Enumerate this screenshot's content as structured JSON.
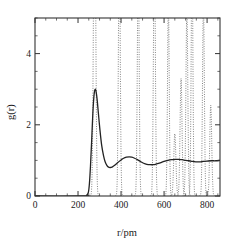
{
  "chart_data": {
    "type": "line",
    "title": "",
    "xlabel": "r/pm",
    "ylabel": "g(r)",
    "xlim": [
      0,
      860
    ],
    "ylim": [
      0,
      5.0
    ],
    "xticks": [
      0,
      200,
      400,
      600,
      800
    ],
    "xtick_labels": [
      "0",
      "200",
      "400",
      "600",
      "800"
    ],
    "yticks": [
      0,
      2,
      4
    ],
    "ytick_labels": [
      "0",
      "2",
      "4"
    ],
    "xminor_interval": 50,
    "yminor_interval": 0.5,
    "grid": false,
    "legend": null,
    "series": [
      {
        "name": "liquid radial distribution function",
        "style": "solid",
        "color": "#222222",
        "linewidth": 1.3,
        "points": [
          [
            0,
            0
          ],
          [
            230,
            0
          ],
          [
            240,
            0.02
          ],
          [
            248,
            0.1
          ],
          [
            253,
            0.35
          ],
          [
            258,
            0.85
          ],
          [
            263,
            1.5
          ],
          [
            268,
            2.2
          ],
          [
            272,
            2.65
          ],
          [
            276,
            2.92
          ],
          [
            280,
            3.0
          ],
          [
            284,
            2.93
          ],
          [
            289,
            2.7
          ],
          [
            295,
            2.3
          ],
          [
            302,
            1.85
          ],
          [
            310,
            1.42
          ],
          [
            318,
            1.15
          ],
          [
            326,
            0.96
          ],
          [
            334,
            0.86
          ],
          [
            342,
            0.81
          ],
          [
            350,
            0.8
          ],
          [
            360,
            0.82
          ],
          [
            372,
            0.87
          ],
          [
            385,
            0.94
          ],
          [
            398,
            1.0
          ],
          [
            412,
            1.06
          ],
          [
            425,
            1.09
          ],
          [
            438,
            1.1
          ],
          [
            450,
            1.09
          ],
          [
            463,
            1.06
          ],
          [
            476,
            1.02
          ],
          [
            490,
            0.97
          ],
          [
            505,
            0.92
          ],
          [
            520,
            0.89
          ],
          [
            535,
            0.88
          ],
          [
            550,
            0.88
          ],
          [
            565,
            0.9
          ],
          [
            582,
            0.93
          ],
          [
            600,
            0.97
          ],
          [
            618,
            1.0
          ],
          [
            635,
            1.02
          ],
          [
            652,
            1.03
          ],
          [
            668,
            1.03
          ],
          [
            685,
            1.02
          ],
          [
            700,
            1.0
          ],
          [
            716,
            0.99
          ],
          [
            732,
            0.97
          ],
          [
            748,
            0.96
          ],
          [
            765,
            0.96
          ],
          [
            782,
            0.97
          ],
          [
            800,
            0.98
          ],
          [
            820,
            0.99
          ],
          [
            840,
            0.99
          ],
          [
            860,
            1.0
          ]
        ]
      },
      {
        "name": "crystal radial distribution function",
        "style": "dotted",
        "color": "#555555",
        "linewidth": 0.8,
        "peaks": [
          {
            "center": 277,
            "height": 9.5,
            "width": 5.0,
            "clipped": true
          },
          {
            "center": 392,
            "height": 7.2,
            "width": 4.2,
            "clipped": true
          },
          {
            "center": 480,
            "height": 6.6,
            "width": 4.2,
            "clipped": true
          },
          {
            "center": 555,
            "height": 7.0,
            "width": 4.4,
            "clipped": true
          },
          {
            "center": 620,
            "height": 5.4,
            "width": 4.0,
            "clipped": true
          },
          {
            "center": 650,
            "height": 1.75,
            "width": 5.0,
            "clipped": false
          },
          {
            "center": 679,
            "height": 3.3,
            "width": 4.6,
            "clipped": false
          },
          {
            "center": 706,
            "height": 5.2,
            "width": 4.4,
            "clipped": true
          },
          {
            "center": 730,
            "height": 6.8,
            "width": 4.0,
            "clipped": true
          },
          {
            "center": 783,
            "height": 5.4,
            "width": 4.2,
            "clipped": true
          },
          {
            "center": 817,
            "height": 2.55,
            "width": 4.6,
            "clipped": false
          }
        ]
      }
    ]
  },
  "figure": {
    "background_color": "#ffffff",
    "frame_color": "#333333"
  }
}
